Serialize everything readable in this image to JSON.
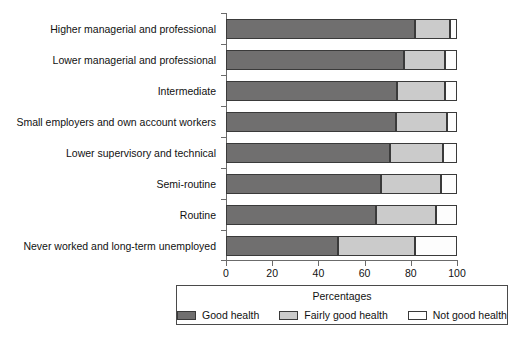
{
  "chart_data": {
    "type": "bar",
    "orientation": "horizontal",
    "stacked": true,
    "title": "",
    "xlabel": "",
    "ylabel": "",
    "xlim": [
      0,
      100
    ],
    "xticks": [
      0,
      20,
      40,
      60,
      80,
      100
    ],
    "xtick_labels": [
      "0",
      "20",
      "40",
      "60",
      "80",
      "100"
    ],
    "grid": false,
    "legend_position": "bottom",
    "legend_title": "Percentages",
    "categories": [
      "Higher managerial and professional",
      "Lower managerial and professional",
      "Intermediate",
      "Small employers and own account workers",
      "Lower supervisory and technical",
      "Semi-routine",
      "Routine",
      "Never worked and long-term unemployed"
    ],
    "series": [
      {
        "name": "Good health",
        "color": "#706f6f",
        "values": [
          82,
          77,
          74,
          73.5,
          71,
          67,
          65,
          48.5
        ]
      },
      {
        "name": "Fairly good health",
        "color": "#cbcbcb",
        "values": [
          15,
          18,
          21,
          22,
          23,
          26,
          26,
          33.5
        ]
      },
      {
        "name": "Not good health",
        "color": "#ffffff",
        "values": [
          3,
          5,
          5,
          4.5,
          6,
          7,
          9,
          18
        ]
      }
    ]
  },
  "legend": {
    "title": "Percentages",
    "entries": [
      {
        "label": "Good health",
        "swatch": "good"
      },
      {
        "label": "Fairly good health",
        "swatch": "fairly"
      },
      {
        "label": "Not good health",
        "swatch": "notgood"
      }
    ]
  }
}
